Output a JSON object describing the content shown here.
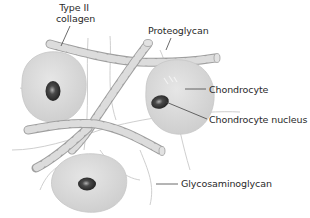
{
  "diagram": {
    "labels": {
      "type2_collagen_line1": "Type II",
      "type2_collagen_line2": "collagen",
      "proteoglycan": "Proteoglycan",
      "chondrocyte": "Chondrocyte",
      "chondrocyte_nucleus": "Chondrocyte nucleus",
      "glycosaminoglycan": "Glycosaminoglycan"
    },
    "colors": {
      "cell_fill": "#d9d9d9",
      "cell_edge": "#c4c4c4",
      "nucleus": "#2b2b2b",
      "nucleus_highlight": "#9a9a9a",
      "fibril_light": "#dcdcdc",
      "fibril_dark": "#9e9e9e",
      "strand": "#cfcfcf",
      "leader_line": "#444444",
      "text": "#2a2a2a"
    },
    "cells": [
      {
        "name": "left-chondrocyte",
        "cx": 52,
        "cy": 88,
        "rx": 34,
        "ry": 36
      },
      {
        "name": "right-chondrocyte",
        "cx": 180,
        "cy": 98,
        "rx": 36,
        "ry": 38
      },
      {
        "name": "bottom-chondrocyte",
        "cx": 89,
        "cy": 185,
        "rx": 40,
        "ry": 32
      }
    ]
  }
}
